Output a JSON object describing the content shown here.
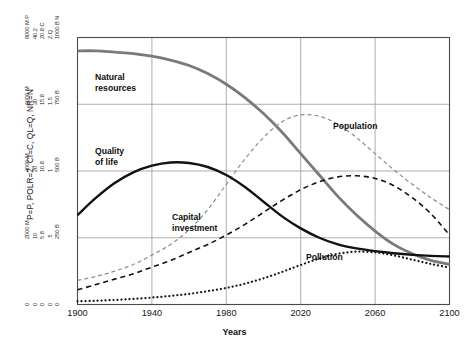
{
  "chart_data": {
    "type": "line",
    "title": "",
    "xlabel": "Years",
    "ylabel": "P=P, POLR=2, CI=C, QL=Q, NR=N",
    "xlim": [
      1900,
      2100
    ],
    "ylim": [
      0,
      1
    ],
    "grid": true,
    "legend_position": "inline-labels",
    "x_ticks": [
      "1900",
      "1940",
      "1980",
      "2020",
      "2060",
      "2100"
    ],
    "x_tick_values": [
      1900,
      1940,
      1980,
      2020,
      2060,
      2100
    ],
    "y_tick_rows": [
      {
        "fraction": 1.0,
        "labels": [
          "8000 M P",
          "40.2",
          "20.8 C",
          "2.Q",
          "1000 B N"
        ]
      },
      {
        "fraction": 0.75,
        "labels": [
          "6000 M",
          "30",
          "15.8",
          "1.5",
          "750 B"
        ]
      },
      {
        "fraction": 0.5,
        "labels": [
          "4000 M",
          "20",
          "10.8",
          "1",
          "500 B"
        ]
      },
      {
        "fraction": 0.25,
        "labels": [
          "2000 M",
          "10",
          "5.8",
          ".5",
          "250 B"
        ]
      },
      {
        "fraction": 0.0,
        "labels": [
          "0",
          "0",
          "0",
          "0",
          "0"
        ]
      }
    ],
    "series": [
      {
        "name": "Natural resources",
        "key": "natural_resources",
        "color": "#7a7a7a",
        "style": "solid",
        "width": 2.8,
        "label_x": 95,
        "label_y": 72,
        "label_lines": [
          "Natural",
          "resources"
        ],
        "x": [
          1900,
          1910,
          1920,
          1930,
          1940,
          1950,
          1960,
          1970,
          1980,
          1990,
          2000,
          2010,
          2020,
          2030,
          2040,
          2050,
          2060,
          2070,
          2080,
          2090,
          2100
        ],
        "y": [
          0.95,
          0.95,
          0.945,
          0.94,
          0.93,
          0.915,
          0.895,
          0.865,
          0.825,
          0.775,
          0.715,
          0.645,
          0.565,
          0.485,
          0.405,
          0.335,
          0.275,
          0.225,
          0.19,
          0.165,
          0.15
        ]
      },
      {
        "name": "Population",
        "key": "population",
        "color": "#8f8f8f",
        "style": "dashed",
        "width": 1.25,
        "label_x": 333,
        "label_y": 121,
        "label_lines": [
          "Population"
        ],
        "x": [
          1900,
          1910,
          1920,
          1930,
          1940,
          1950,
          1960,
          1970,
          1980,
          1990,
          2000,
          2010,
          2020,
          2030,
          2040,
          2050,
          2060,
          2070,
          2080,
          2090,
          2100
        ],
        "y": [
          0.09,
          0.105,
          0.125,
          0.15,
          0.185,
          0.225,
          0.28,
          0.355,
          0.45,
          0.545,
          0.625,
          0.685,
          0.71,
          0.705,
          0.675,
          0.625,
          0.565,
          0.505,
          0.45,
          0.4,
          0.355
        ]
      },
      {
        "name": "Quality of life",
        "key": "quality_of_life",
        "color": "#111111",
        "style": "solid",
        "width": 2.4,
        "label_x": 95,
        "label_y": 146,
        "label_lines": [
          "Quality",
          "of life"
        ],
        "x": [
          1900,
          1910,
          1920,
          1930,
          1940,
          1950,
          1960,
          1970,
          1980,
          1990,
          2000,
          2010,
          2020,
          2030,
          2040,
          2050,
          2060,
          2070,
          2080,
          2090,
          2100
        ],
        "y": [
          0.335,
          0.4,
          0.455,
          0.495,
          0.52,
          0.532,
          0.53,
          0.515,
          0.485,
          0.44,
          0.385,
          0.33,
          0.285,
          0.25,
          0.225,
          0.21,
          0.2,
          0.192,
          0.186,
          0.182,
          0.18
        ]
      },
      {
        "name": "Capital investment",
        "key": "capital_investment",
        "color": "#111111",
        "style": "dashed",
        "width": 1.6,
        "label_x": 172,
        "label_y": 212,
        "label_lines": [
          "Capital",
          "investment"
        ],
        "x": [
          1900,
          1910,
          1920,
          1930,
          1940,
          1950,
          1960,
          1970,
          1980,
          1990,
          2000,
          2010,
          2020,
          2030,
          2040,
          2050,
          2060,
          2070,
          2080,
          2090,
          2100
        ],
        "y": [
          0.055,
          0.075,
          0.095,
          0.115,
          0.14,
          0.165,
          0.195,
          0.225,
          0.26,
          0.3,
          0.345,
          0.39,
          0.43,
          0.46,
          0.478,
          0.482,
          0.472,
          0.445,
          0.4,
          0.34,
          0.26
        ]
      },
      {
        "name": "Pollution",
        "key": "pollution",
        "color": "#161616",
        "style": "dotted",
        "width": 2.2,
        "label_x": 306,
        "label_y": 252,
        "label_lines": [
          "Pollution"
        ],
        "x": [
          1900,
          1910,
          1920,
          1930,
          1940,
          1950,
          1960,
          1970,
          1980,
          1990,
          2000,
          2010,
          2020,
          2030,
          2040,
          2050,
          2060,
          2070,
          2080,
          2090,
          2100
        ],
        "y": [
          0.012,
          0.014,
          0.017,
          0.021,
          0.026,
          0.032,
          0.04,
          0.05,
          0.062,
          0.078,
          0.098,
          0.122,
          0.148,
          0.172,
          0.19,
          0.198,
          0.195,
          0.184,
          0.168,
          0.152,
          0.138
        ]
      }
    ],
    "colors": {
      "frame": "#4a4a4a",
      "grid": "#9a9a9a",
      "background": "#ffffff",
      "text": "#161616"
    }
  }
}
